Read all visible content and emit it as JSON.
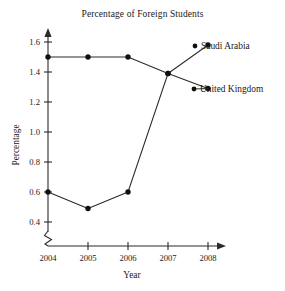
{
  "chart_data": {
    "type": "line",
    "title": "Percentage of Foreign Students",
    "xlabel": "Year",
    "ylabel": "Percentage",
    "categories": [
      "2004",
      "2005",
      "2006",
      "2007",
      "2008"
    ],
    "x": [
      2004,
      2005,
      2006,
      2007,
      2008
    ],
    "xlim": [
      2004,
      2008
    ],
    "ylim": [
      0.3,
      1.68
    ],
    "ytick_labels": [
      "0.4",
      "0.6",
      "0.8",
      "1.0",
      "1.2",
      "1.4",
      "1.6"
    ],
    "yticks": [
      0.4,
      0.6,
      0.8,
      1.0,
      1.2,
      1.4,
      1.6
    ],
    "grid": false,
    "legend_position": "right-of-line-ends",
    "axis_break": true,
    "axis_break_note": "zigzag break on y-axis below 0.4",
    "series": [
      {
        "name": "Saudi Arabia",
        "values": [
          0.6,
          0.49,
          0.6,
          1.39,
          1.58
        ],
        "marker": "filled-circle",
        "color": "#111111"
      },
      {
        "name": "United Kingdom",
        "values": [
          1.5,
          1.5,
          1.5,
          1.39,
          1.29
        ],
        "marker": "filled-circle",
        "color": "#111111"
      }
    ]
  },
  "labels": {
    "title": "Percentage of Foreign Students",
    "y_axis_title": "Percentage",
    "x_axis_title": "Year",
    "series_saudi": "Saudi Arabia",
    "series_uk": "United Kingdom",
    "y0": "0.4",
    "y1": "0.6",
    "y2": "0.8",
    "y3": "1.0",
    "y4": "1.2",
    "y5": "1.4",
    "y6": "1.6",
    "x0": "2004",
    "x1": "2005",
    "x2": "2006",
    "x3": "2007",
    "x4": "2008"
  }
}
